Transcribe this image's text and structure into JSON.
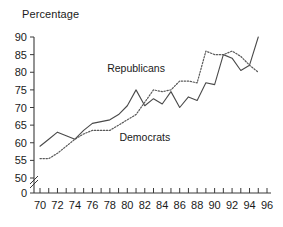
{
  "chart_data": {
    "type": "line",
    "title": "Percentage",
    "xlabel": "",
    "ylabel": "Percentage",
    "xlim": [
      70,
      96
    ],
    "ylim": [
      50,
      90
    ],
    "y_axis_has_break": true,
    "y_break_from": 0,
    "y_break_to": 50,
    "grid": false,
    "legend_position": "inline-annotation",
    "y_ticks": [
      0,
      50,
      55,
      60,
      65,
      70,
      75,
      80,
      85,
      90
    ],
    "y_tick_labels": [
      "0",
      "50",
      "55",
      "60",
      "65",
      "70",
      "75",
      "80",
      "85",
      "90"
    ],
    "x_ticks": [
      70,
      71,
      72,
      73,
      74,
      75,
      76,
      77,
      78,
      79,
      80,
      81,
      82,
      83,
      84,
      85,
      86,
      87,
      88,
      89,
      90,
      91,
      92,
      93,
      94,
      95,
      96
    ],
    "x_tick_labels": [
      "70",
      "",
      "72",
      "",
      "74",
      "",
      "76",
      "",
      "78",
      "",
      "80",
      "",
      "82",
      "",
      "84",
      "",
      "86",
      "",
      "88",
      "",
      "90",
      "",
      "92",
      "",
      "94",
      "",
      "96"
    ],
    "x": [
      70,
      71,
      72,
      73,
      74,
      75,
      76,
      77,
      78,
      79,
      80,
      81,
      82,
      83,
      84,
      85,
      86,
      87,
      88,
      89,
      90,
      91,
      92,
      93,
      94,
      95
    ],
    "series": [
      {
        "name": "Republicans",
        "style": "solid",
        "label_x": 81,
        "label_y": 80,
        "values": [
          59.0,
          61.0,
          63.0,
          62.0,
          61.0,
          63.5,
          65.5,
          66.0,
          66.5,
          68.0,
          70.5,
          75.0,
          70.5,
          72.5,
          71.0,
          74.5,
          70.0,
          73.0,
          72.0,
          77.0,
          76.5,
          85.0,
          84.0,
          80.5,
          82.0,
          90.0
        ]
      },
      {
        "name": "Democrats",
        "style": "dotted",
        "label_x": 82,
        "label_y": 60.5,
        "values": [
          55.5,
          55.5,
          57.0,
          59.0,
          61.0,
          62.5,
          63.5,
          63.5,
          63.5,
          65.0,
          66.5,
          68.0,
          71.5,
          75.0,
          74.5,
          75.0,
          77.5,
          77.5,
          77.0,
          86.0,
          85.0,
          85.0,
          86.0,
          84.5,
          82.0,
          80.0
        ]
      }
    ]
  }
}
